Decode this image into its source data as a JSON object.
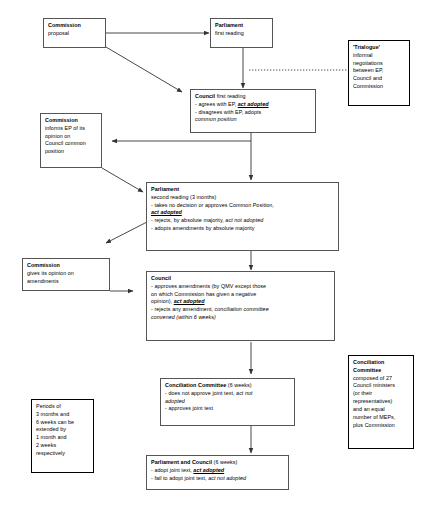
{
  "diagram": {
    "type": "flowchart",
    "stroke_color": "#555555",
    "emphasis_color": "#000000",
    "nodes": [
      {
        "id": "commission-proposal",
        "name": "commission-proposal-box",
        "heading": "Commission",
        "lines": [
          "proposal"
        ]
      },
      {
        "id": "parliament-first-reading",
        "name": "parliament-first-reading-box",
        "heading": "Parliament",
        "lines": [
          "first reading"
        ]
      },
      {
        "id": "trialogue",
        "name": "trialogue-box",
        "heading": "'Trialogue'",
        "lines": [
          "informal",
          "negotiations",
          "between EP,",
          "Council and",
          "Commission"
        ]
      },
      {
        "id": "council-first-reading",
        "name": "council-first-reading-box",
        "heading": "Council",
        "heading_tail": " first reading",
        "lines": [
          "- agrees with EP, act adopted",
          "- disagrees with EP, adopts",
          "common position"
        ]
      },
      {
        "id": "commission-informs-ep",
        "name": "commission-informs-ep-box",
        "heading": "Commission",
        "lines": [
          "informs EP of its",
          "opinion on",
          "Council common",
          "position"
        ]
      },
      {
        "id": "parliament-second-reading",
        "name": "parliament-second-reading-box",
        "heading": "Parliament",
        "lines": [
          "second reading (3 months)",
          "- takes no decision or approves Common Position,",
          "act adopted",
          "- rejects, by absolute majority, act not adopted",
          "- adopts amendments by absolute majority"
        ]
      },
      {
        "id": "commission-opinion-amendments",
        "name": "commission-opinion-amendments-box",
        "heading": "Commission",
        "lines": [
          "gives its opinion on",
          "amendments"
        ]
      },
      {
        "id": "council-second",
        "name": "council-second-reading-box",
        "heading": "Council",
        "lines": [
          "- approves amendments (by QMV except those",
          "on which Commission has given a negative",
          "opinion), act adopted",
          "- rejects any amendment, conciliation committee",
          "convened (within 6 weeks)"
        ]
      },
      {
        "id": "conciliation-committee-step",
        "name": "conciliation-committee-box",
        "heading": "Conciliation Committee",
        "heading_tail": " (6 weeks)",
        "lines": [
          "- does not approve joint text, act not",
          "adopted",
          "- approves joint text"
        ]
      },
      {
        "id": "conciliation-committee-note",
        "name": "conciliation-committee-composition-box",
        "heading_lines": [
          "Conciliation",
          "Committee"
        ],
        "lines": [
          "composed of 27",
          "Council ministers",
          "(or their",
          "representatives)",
          "and an equal",
          "number of MEPs,",
          "plus Commission"
        ]
      },
      {
        "id": "periods-note",
        "name": "periods-note-box",
        "lines": [
          "Periods of",
          "3 months and",
          "6 weeks can be",
          "extended by",
          "1 month and",
          "2 weeks",
          "respectively"
        ]
      },
      {
        "id": "parliament-and-council",
        "name": "parliament-and-council-box",
        "heading": "Parliament and Council",
        "heading_tail": " (6 weeks)",
        "lines": [
          "- adopt joint text, act adopted",
          "- fail to adopt joint text, act not adopted"
        ]
      }
    ],
    "edges": [
      {
        "name": "edge-commission-to-parliament-first",
        "from": "commission-proposal",
        "to": "parliament-first-reading",
        "style": "solid-arrow"
      },
      {
        "name": "edge-commission-to-council-first",
        "from": "commission-proposal",
        "to": "council-first-reading",
        "style": "solid-arrow-diagonal"
      },
      {
        "name": "edge-parliament-first-to-council-first",
        "from": "parliament-first-reading",
        "to": "council-first-reading",
        "style": "solid-arrow"
      },
      {
        "name": "edge-trialogue-dotted",
        "from": "trialogue",
        "to": "parliament-council-channel",
        "style": "dotted"
      },
      {
        "name": "edge-council-first-to-commission-informs",
        "from": "council-first-reading",
        "to": "commission-informs-ep",
        "style": "solid-arrow"
      },
      {
        "name": "edge-council-first-to-parliament-second",
        "from": "council-first-reading",
        "to": "parliament-second-reading",
        "style": "solid-arrow"
      },
      {
        "name": "edge-commission-informs-to-parliament-second",
        "from": "commission-informs-ep",
        "to": "parliament-second-reading",
        "style": "solid-arrow-diagonal"
      },
      {
        "name": "edge-parliament-second-to-commission-opinion",
        "from": "parliament-second-reading",
        "to": "commission-opinion-amendments",
        "style": "solid-arrow-diagonal"
      },
      {
        "name": "edge-parliament-second-to-council-second",
        "from": "parliament-second-reading",
        "to": "council-second",
        "style": "solid-arrow"
      },
      {
        "name": "edge-commission-opinion-to-council-second",
        "from": "commission-opinion-amendments",
        "to": "council-second",
        "style": "solid-arrow"
      },
      {
        "name": "edge-council-second-to-conciliation",
        "from": "council-second",
        "to": "conciliation-committee-step",
        "style": "solid-arrow"
      },
      {
        "name": "edge-conciliation-to-parliament-and-council",
        "from": "conciliation-committee-step",
        "to": "parliament-and-council",
        "style": "solid-arrow"
      }
    ]
  }
}
